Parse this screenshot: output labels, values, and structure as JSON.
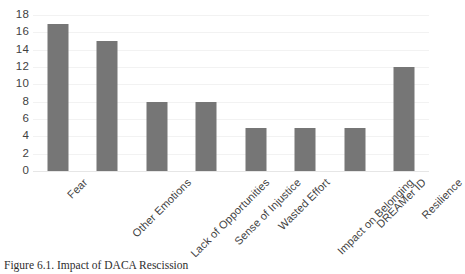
{
  "caption": "Figure 6.1. Impact of DACA Rescission",
  "style": {
    "bar_color": "#767676",
    "gridline_color": "#f2f2f2",
    "axis_color": "#e6e6e6",
    "text_color": "#3f3f3f",
    "background": "#ffffff"
  },
  "chart_data": {
    "type": "bar",
    "title": "",
    "subtitle": "",
    "xlabel": "",
    "ylabel": "",
    "categories": [
      "Fear",
      "Other Emotions",
      "Lack of Opportunities",
      "Sense of Injustice",
      "Wasted Effort",
      "Impact on Belonging",
      "DREAMer ID",
      "Resilience"
    ],
    "values": [
      17,
      15,
      8,
      8,
      5,
      5,
      5,
      12
    ],
    "ylim": [
      0,
      18
    ],
    "yticks": [
      0,
      2,
      4,
      6,
      8,
      10,
      12,
      14,
      16,
      18
    ],
    "ytick_labels": [
      "0",
      "2",
      "4",
      "6",
      "8",
      "10",
      "12",
      "14",
      "16",
      "18"
    ],
    "grid": true,
    "grid_axis": "y",
    "legend": false,
    "legend_position": "none",
    "xtick_rotation": -45,
    "annotations": []
  }
}
